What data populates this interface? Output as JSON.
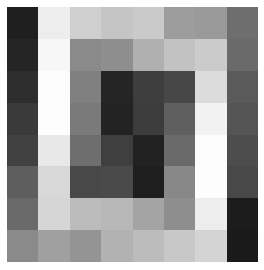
{
  "figure": {
    "kind": "grayscale-pixel-grid",
    "background_color": "#ffffff",
    "margin_left_px": 7,
    "margin_top_px": 7,
    "plot_width_px": 251,
    "plot_height_px": 255
  },
  "chart_data": {
    "type": "heatmap",
    "title": "",
    "subtitle": "",
    "xlabel": "",
    "ylabel": "",
    "grid": false,
    "legend": "none",
    "colormap": "gray",
    "rows": 8,
    "cols": 8,
    "x": [
      0,
      1,
      2,
      3,
      4,
      5,
      6,
      7
    ],
    "y": [
      0,
      1,
      2,
      3,
      4,
      5,
      6,
      7
    ],
    "xticklabels": [],
    "yticklabels": [],
    "vmin": 0,
    "vmax": 255,
    "values": [
      [
        31,
        237,
        207,
        197,
        202,
        157,
        154,
        110
      ],
      [
        37,
        247,
        138,
        142,
        176,
        194,
        203,
        106
      ],
      [
        46,
        252,
        128,
        37,
        62,
        71,
        220,
        90
      ],
      [
        58,
        253,
        122,
        35,
        60,
        95,
        242,
        85
      ],
      [
        65,
        232,
        110,
        63,
        34,
        106,
        252,
        77
      ],
      [
        94,
        216,
        72,
        74,
        30,
        136,
        253,
        72
      ],
      [
        106,
        214,
        188,
        184,
        164,
        142,
        237,
        28
      ],
      [
        138,
        160,
        148,
        178,
        188,
        200,
        212,
        26
      ]
    ],
    "colors": [
      [
        "#1f1f1f",
        "#ededed",
        "#cfcfcf",
        "#c5c5c5",
        "#cacaca",
        "#9d9d9d",
        "#9a9a9a",
        "#6e6e6e"
      ],
      [
        "#252525",
        "#f7f7f7",
        "#8a8a8a",
        "#8e8e8e",
        "#b0b0b0",
        "#c2c2c2",
        "#cbcbcb",
        "#6a6a6a"
      ],
      [
        "#2e2e2e",
        "#fcfcfc",
        "#808080",
        "#252525",
        "#3e3e3e",
        "#474747",
        "#dcdcdc",
        "#5a5a5a"
      ],
      [
        "#3a3a3a",
        "#fdfdfd",
        "#7a7a7a",
        "#232323",
        "#3c3c3c",
        "#5f5f5f",
        "#f2f2f2",
        "#555555"
      ],
      [
        "#414141",
        "#e8e8e8",
        "#6e6e6e",
        "#3f3f3f",
        "#222222",
        "#6a6a6a",
        "#fcfcfc",
        "#4d4d4d"
      ],
      [
        "#5e5e5e",
        "#d8d8d8",
        "#484848",
        "#4a4a4a",
        "#1e1e1e",
        "#888888",
        "#fdfdfd",
        "#484848"
      ],
      [
        "#6a6a6a",
        "#d6d6d6",
        "#bcbcbc",
        "#b8b8b8",
        "#a4a4a4",
        "#8e8e8e",
        "#ededed",
        "#1c1c1c"
      ],
      [
        "#8a8a8a",
        "#a0a0a0",
        "#949494",
        "#b2b2b2",
        "#bcbcbc",
        "#c8c8c8",
        "#d4d4d4",
        "#1a1a1a"
      ]
    ]
  }
}
